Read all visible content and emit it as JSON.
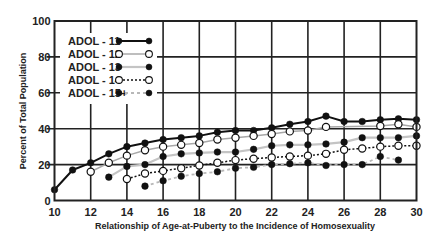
{
  "chart_data": {
    "type": "line",
    "title": "",
    "xlabel": "Relationship of Age-at-Puberty to the Incidence of Homosexuality",
    "ylabel": "Percent of Total Population",
    "xlim": [
      10,
      30
    ],
    "ylim": [
      0,
      100
    ],
    "x_ticks": [
      10,
      12,
      14,
      16,
      18,
      20,
      22,
      24,
      26,
      28,
      30
    ],
    "y_ticks": [
      0,
      20,
      40,
      60,
      80,
      100
    ],
    "grid": true,
    "legend_position": "upper-left",
    "series": [
      {
        "name": "ADOL - 11",
        "style": {
          "line_color": "#111111",
          "line_width": 2,
          "dash": "",
          "marker": "filled",
          "marker_color": "#111111"
        },
        "x": [
          10,
          11,
          12,
          13,
          14,
          15,
          16,
          17,
          18,
          19,
          20,
          21,
          22,
          23,
          24,
          25,
          26,
          27,
          28,
          29,
          30
        ],
        "values": [
          6,
          17,
          21,
          26,
          30,
          32,
          34,
          35,
          36,
          38,
          39,
          39,
          40.5,
          42.5,
          44,
          47,
          44,
          44,
          45,
          45.5,
          45
        ]
      },
      {
        "name": "ADOL - 12",
        "style": {
          "line_color": "#a8a8a8",
          "line_width": 1.5,
          "dash": "",
          "marker": "open",
          "marker_color": "#111111"
        },
        "x": [
          12,
          13,
          14,
          15,
          16,
          17,
          18,
          19,
          20,
          21,
          22,
          23,
          24,
          25,
          28,
          29,
          30
        ],
        "values": [
          16,
          21,
          25,
          28,
          30,
          31,
          32,
          34,
          35,
          36,
          37,
          38.5,
          39,
          41,
          41.5,
          42.5,
          41
        ]
      },
      {
        "name": "ADOL - 13",
        "style": {
          "line_color": "#c4c4c4",
          "line_width": 2.2,
          "dash": "",
          "marker": "filled",
          "marker_color": "#111111"
        },
        "x": [
          13,
          14,
          15,
          16,
          17,
          18,
          19,
          20,
          21,
          22,
          23,
          24,
          25,
          26,
          27,
          28,
          29,
          30
        ],
        "values": [
          13,
          19,
          20,
          24.5,
          26,
          26.5,
          27,
          27,
          28.5,
          30.5,
          31,
          31,
          31.5,
          32.5,
          35,
          35,
          35,
          36
        ]
      },
      {
        "name": "ADOL - 14",
        "style": {
          "line_color": "#111111",
          "line_width": 1.5,
          "dash": "2,2",
          "marker": "open",
          "marker_color": "#111111"
        },
        "x": [
          14,
          15,
          16,
          17,
          18,
          19,
          20,
          21,
          22,
          23,
          24,
          25,
          26,
          27,
          28,
          29,
          30
        ],
        "values": [
          12,
          15,
          16.5,
          18,
          19.5,
          21,
          22.5,
          23.3,
          24,
          24.5,
          25,
          26,
          28.3,
          29,
          30,
          30.5,
          30.5
        ]
      },
      {
        "name": "ADOL - 15+",
        "style": {
          "line_color": "#b8b8b8",
          "line_width": 1.8,
          "dash": "3,3",
          "marker": "filled",
          "marker_color": "#111111"
        },
        "x": [
          15,
          16,
          17,
          18,
          19,
          20,
          21,
          22,
          23,
          24,
          25,
          26,
          27,
          28,
          29
        ],
        "values": [
          8,
          11,
          13.5,
          15,
          16,
          18,
          18.5,
          20,
          20.5,
          21,
          19.5,
          20,
          20,
          24.5,
          22.5
        ]
      }
    ]
  }
}
